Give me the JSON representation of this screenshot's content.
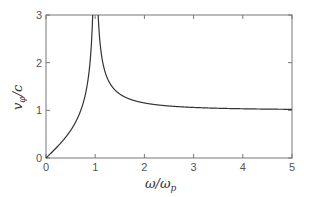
{
  "chart_data": {
    "type": "line",
    "title": "",
    "xlabel": "ω/ω_p",
    "ylabel": "v_φ/c",
    "xlabel_main": "ω/ω",
    "xlabel_sub": "p",
    "ylabel_main": "v",
    "ylabel_sub": "φ",
    "ylabel_tail": "/c",
    "xlim": [
      0,
      5
    ],
    "ylim": [
      0,
      3
    ],
    "xticks": [
      0,
      1,
      2,
      3,
      4,
      5
    ],
    "yticks": [
      0,
      1,
      2,
      3
    ],
    "xtick_labels": [
      "0",
      "1",
      "2",
      "3",
      "4",
      "5"
    ],
    "ytick_labels": [
      "0",
      "1",
      "2",
      "3"
    ],
    "grid": false,
    "legend": "none",
    "series": [
      {
        "name": "below plasma frequency",
        "formula": "x / sqrt(1 - x^2)",
        "x": [
          0,
          0.1,
          0.2,
          0.3,
          0.4,
          0.5,
          0.6,
          0.7,
          0.8,
          0.85,
          0.9,
          0.93,
          0.95
        ],
        "y": [
          0,
          0.1,
          0.2,
          0.31,
          0.44,
          0.58,
          0.75,
          0.98,
          1.33,
          1.61,
          2.06,
          2.53,
          3.0
        ]
      },
      {
        "name": "above plasma frequency",
        "formula": "1 / sqrt(1 - 1/x^2)",
        "x": [
          1.06,
          1.1,
          1.2,
          1.3,
          1.5,
          1.75,
          2,
          2.5,
          3,
          3.5,
          4,
          4.5,
          5
        ],
        "y": [
          3.0,
          2.4,
          1.81,
          1.56,
          1.34,
          1.22,
          1.15,
          1.09,
          1.06,
          1.04,
          1.03,
          1.03,
          1.02
        ]
      }
    ],
    "line_color": "#333333",
    "axis_color": "#777777"
  }
}
